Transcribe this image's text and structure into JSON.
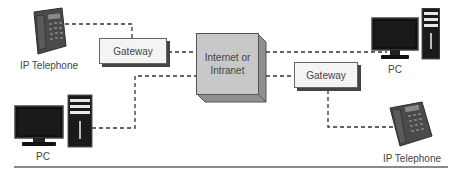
{
  "diagram": {
    "nodes": {
      "phone_top_left": {
        "label": "IP Telephone",
        "icon": "ip-telephone-icon"
      },
      "gateway_left": {
        "label": "Gateway"
      },
      "internet": {
        "label_line1": "Internet or",
        "label_line2": "Intranet"
      },
      "pc_top_right": {
        "label": "PC",
        "icon": "desktop-pc-icon"
      },
      "gateway_right": {
        "label": "Gateway"
      },
      "pc_bottom_left": {
        "label": "PC",
        "icon": "desktop-pc-icon"
      },
      "phone_bottom_right": {
        "label": "IP Telephone",
        "icon": "ip-telephone-icon"
      }
    },
    "connections": [
      {
        "from": "IP Telephone (top-left)",
        "to": "Gateway (left)",
        "style": "dashed"
      },
      {
        "from": "Gateway (left)",
        "to": "Internet or Intranet",
        "style": "dashed"
      },
      {
        "from": "PC (bottom-left)",
        "to": "Internet or Intranet",
        "style": "dashed"
      },
      {
        "from": "Internet or Intranet",
        "to": "PC (top-right)",
        "style": "dashed"
      },
      {
        "from": "Internet or Intranet",
        "to": "Gateway (right)",
        "style": "dashed"
      },
      {
        "from": "Gateway (right)",
        "to": "IP Telephone (bottom-right)",
        "style": "dashed"
      }
    ],
    "colors": {
      "line": "#333333",
      "cloud_box": "#c8c8c8",
      "gateway_box": "#f4f4f4",
      "divider": "#8a8a8a"
    }
  }
}
